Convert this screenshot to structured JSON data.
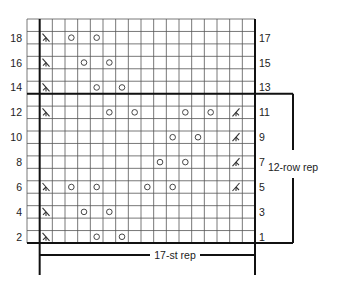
{
  "chart_data": {
    "type": "knitting-chart",
    "columns": 18,
    "rows": 18,
    "stitch_rep_columns": [
      1,
      17
    ],
    "row_rep_rows": [
      1,
      12
    ],
    "stitch_rep_label": "17-st rep",
    "row_rep_label": "12-row rep",
    "left_labels": [
      {
        "row": 1,
        "text": "2"
      },
      {
        "row": 3,
        "text": "4"
      },
      {
        "row": 5,
        "text": "6"
      },
      {
        "row": 7,
        "text": "8"
      },
      {
        "row": 9,
        "text": "10"
      },
      {
        "row": 11,
        "text": "12"
      },
      {
        "row": 13,
        "text": "14"
      },
      {
        "row": 15,
        "text": "16"
      },
      {
        "row": 17,
        "text": "18"
      }
    ],
    "right_labels": [
      {
        "row": 1,
        "text": "1"
      },
      {
        "row": 3,
        "text": "3"
      },
      {
        "row": 5,
        "text": "5"
      },
      {
        "row": 7,
        "text": "7"
      },
      {
        "row": 9,
        "text": "9"
      },
      {
        "row": 11,
        "text": "11"
      },
      {
        "row": 13,
        "text": "13"
      },
      {
        "row": 15,
        "text": "15"
      },
      {
        "row": 17,
        "text": "17"
      }
    ],
    "symbols": [
      {
        "row": 1,
        "col": 1,
        "type": "ssk"
      },
      {
        "row": 1,
        "col": 5,
        "type": "yo"
      },
      {
        "row": 1,
        "col": 7,
        "type": "yo"
      },
      {
        "row": 3,
        "col": 1,
        "type": "ssk"
      },
      {
        "row": 3,
        "col": 4,
        "type": "yo"
      },
      {
        "row": 3,
        "col": 6,
        "type": "yo"
      },
      {
        "row": 5,
        "col": 1,
        "type": "ssk"
      },
      {
        "row": 5,
        "col": 3,
        "type": "yo"
      },
      {
        "row": 5,
        "col": 5,
        "type": "yo"
      },
      {
        "row": 5,
        "col": 9,
        "type": "yo"
      },
      {
        "row": 5,
        "col": 11,
        "type": "yo"
      },
      {
        "row": 5,
        "col": 16,
        "type": "k2tog"
      },
      {
        "row": 7,
        "col": 10,
        "type": "yo"
      },
      {
        "row": 7,
        "col": 12,
        "type": "yo"
      },
      {
        "row": 7,
        "col": 16,
        "type": "k2tog"
      },
      {
        "row": 9,
        "col": 11,
        "type": "yo"
      },
      {
        "row": 9,
        "col": 13,
        "type": "yo"
      },
      {
        "row": 9,
        "col": 16,
        "type": "k2tog"
      },
      {
        "row": 11,
        "col": 1,
        "type": "ssk"
      },
      {
        "row": 11,
        "col": 6,
        "type": "yo"
      },
      {
        "row": 11,
        "col": 8,
        "type": "yo"
      },
      {
        "row": 11,
        "col": 12,
        "type": "yo"
      },
      {
        "row": 11,
        "col": 14,
        "type": "yo"
      },
      {
        "row": 11,
        "col": 16,
        "type": "k2tog"
      },
      {
        "row": 13,
        "col": 1,
        "type": "ssk"
      },
      {
        "row": 13,
        "col": 5,
        "type": "yo"
      },
      {
        "row": 13,
        "col": 7,
        "type": "yo"
      },
      {
        "row": 15,
        "col": 1,
        "type": "ssk"
      },
      {
        "row": 15,
        "col": 4,
        "type": "yo"
      },
      {
        "row": 15,
        "col": 6,
        "type": "yo"
      },
      {
        "row": 17,
        "col": 1,
        "type": "ssk"
      },
      {
        "row": 17,
        "col": 3,
        "type": "yo"
      },
      {
        "row": 17,
        "col": 5,
        "type": "yo"
      }
    ],
    "colors": {
      "grid": "#555555",
      "heavy": "#111111",
      "symbol": "#333333"
    }
  }
}
